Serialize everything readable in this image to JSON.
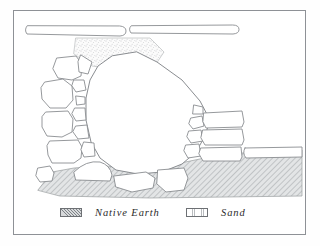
{
  "figure": {
    "kind": "archaeological-cross-section",
    "frame": {
      "border_color": "#8e9196",
      "background": "#ffffff"
    },
    "line_color": "#8a8d91",
    "stone_fill": "#ffffff"
  },
  "legend": {
    "items": [
      {
        "id": "native-earth",
        "label": "Native Earth",
        "pattern": "diagonal-hatch",
        "color": "#a9acaf"
      },
      {
        "id": "sand",
        "label": "Sand",
        "pattern": "stipple",
        "color": "#c9cbcd"
      }
    ]
  },
  "elements": {
    "top_slabs": [
      {
        "name": "upper-left-slab"
      },
      {
        "name": "upper-right-slab"
      }
    ],
    "sand_fill": {
      "name": "sand-wedge",
      "pattern": "stipple"
    },
    "native_earth": {
      "name": "native-earth-layer",
      "pattern": "diagonal-hatch"
    },
    "central_boulder": {
      "name": "central-boulder"
    },
    "left_stones_count": 5,
    "left_chink_count": 6,
    "right_blocks_count": 3,
    "right_chink_count": 4,
    "base_stones_count": 3,
    "right_slab": {
      "name": "lower-right-slab"
    }
  }
}
